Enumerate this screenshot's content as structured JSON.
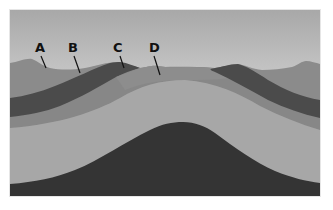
{
  "diagram": {
    "type": "geologic cross-section (anticline)",
    "labels": [
      {
        "id": "A",
        "text": "A",
        "x": 40,
        "y": 52,
        "line": [
          42,
          56,
          47,
          69
        ]
      },
      {
        "id": "B",
        "text": "B",
        "x": 73,
        "y": 52,
        "line": [
          74,
          56,
          81,
          73
        ]
      },
      {
        "id": "C",
        "text": "C",
        "x": 118,
        "y": 52,
        "line": [
          120,
          56,
          125,
          69
        ]
      },
      {
        "id": "D",
        "text": "D",
        "x": 154,
        "y": 52,
        "line": [
          155,
          56,
          161,
          75
        ]
      }
    ],
    "colors": {
      "sky_top": "#a8a8a8",
      "sky_bottom": "#c8c8c8",
      "layer_a": "#8b8b8b",
      "layer_dark_band": "#4b4b4b",
      "layer_medium_band": "#878787",
      "layer_light": "#a7a7a7",
      "core_dark": "#343434",
      "frame_border": "#e6e6e6"
    }
  }
}
